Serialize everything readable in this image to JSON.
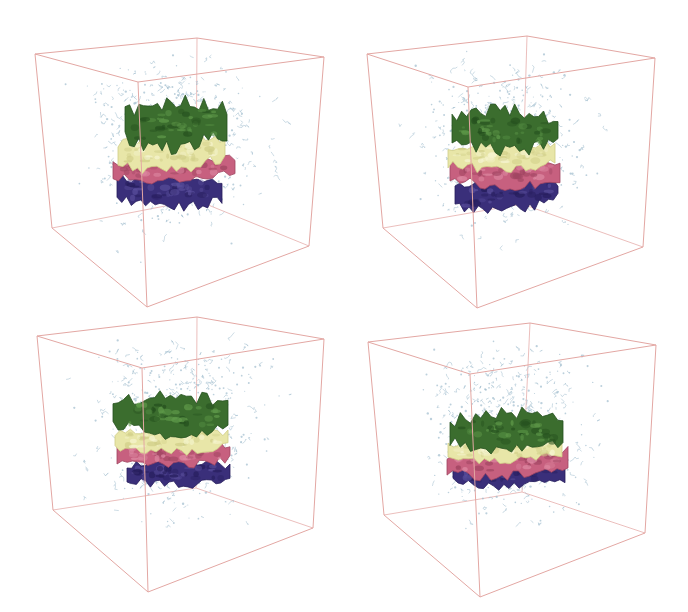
{
  "figure": {
    "box_edge_color": "#e3a7a3",
    "solvent_color": "#9fbccd",
    "layer_order_top_to_bottom": [
      "green",
      "yellow",
      "pink",
      "navy"
    ],
    "layer_colors": {
      "green": {
        "base": "#3b6d2e",
        "dark": "#25501e",
        "light": "#5f9a4a"
      },
      "yellow": {
        "base": "#e8e6a8",
        "dark": "#cfcd86",
        "light": "#f6f5d2"
      },
      "pink": {
        "base": "#c7607f",
        "dark": "#a04561",
        "light": "#de8aa3"
      },
      "navy": {
        "base": "#3a2f7a",
        "dark": "#261d5c",
        "light": "#5a4f9c"
      }
    },
    "panels": [
      {
        "id": "top-left",
        "name": "snapshot-1"
      },
      {
        "id": "top-right",
        "name": "snapshot-2"
      },
      {
        "id": "bottom-left",
        "name": "snapshot-3"
      },
      {
        "id": "bottom-right",
        "name": "snapshot-4"
      }
    ]
  }
}
